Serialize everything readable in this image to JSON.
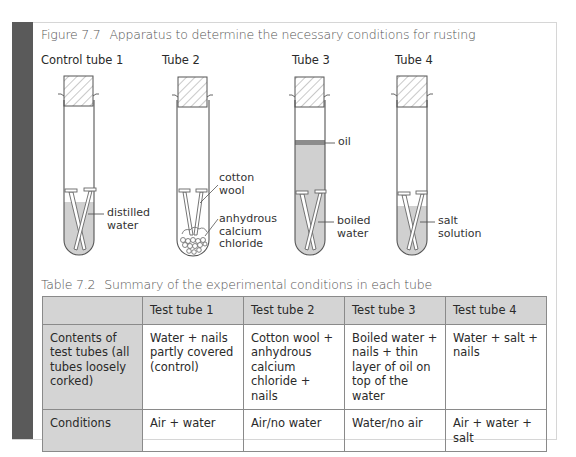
{
  "figure": {
    "number": "Figure 7.7",
    "title": "Apparatus to determine the necessary conditions for rusting",
    "tubes": [
      {
        "title": "Control tube 1",
        "labels": [
          {
            "text": "distilled\nwater"
          }
        ]
      },
      {
        "title": "Tube 2",
        "labels": [
          {
            "text": "cotton\nwool"
          },
          {
            "text": "anhydrous\ncalcium\nchloride"
          }
        ]
      },
      {
        "title": "Tube 3",
        "labels": [
          {
            "text": "oil"
          },
          {
            "text": "boiled\nwater"
          }
        ]
      },
      {
        "title": "Tube 4",
        "labels": [
          {
            "text": "salt\nsolution"
          }
        ]
      }
    ],
    "colors": {
      "liquid": "#d0d0d0",
      "oil": "#8c8c8c",
      "outline": "#555555",
      "side_bar": "#5a5a5a"
    }
  },
  "table": {
    "number": "Table 7.2",
    "title": "Summary of the experimental conditions in each tube",
    "columns": [
      "",
      "Test tube 1",
      "Test tube 2",
      "Test tube 3",
      "Test tube 4"
    ],
    "rows": [
      {
        "header": "Contents of test tubes (all tubes loosely corked)",
        "cells": [
          "Water + nails partly covered (control)",
          "Cotton wool + anhydrous calcium chloride + nails",
          "Boiled water + nails + thin layer of oil on top of the water",
          "Water + salt + nails"
        ]
      },
      {
        "header": "Conditions",
        "cells": [
          "Air + water",
          "Air/no water",
          "Water/no air",
          "Air + water + salt"
        ]
      }
    ]
  }
}
